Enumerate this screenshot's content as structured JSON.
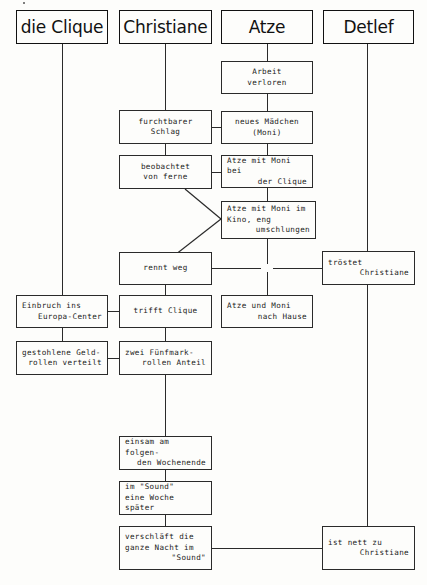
{
  "diagram": {
    "actors": [
      {
        "id": "clique",
        "label": "die Clique"
      },
      {
        "id": "christiane",
        "label": "Christiane"
      },
      {
        "id": "atze",
        "label": "Atze"
      },
      {
        "id": "detlef",
        "label": "Detlef"
      }
    ],
    "nodes": [
      {
        "id": "arbeit",
        "column": "atze",
        "lines": [
          "Arbeit",
          "verloren"
        ],
        "align": "center"
      },
      {
        "id": "schlag",
        "column": "christiane",
        "lines": [
          "furchtbarer",
          "Schlag"
        ],
        "align": "center"
      },
      {
        "id": "moni",
        "column": "atze",
        "lines": [
          "neues Mädchen",
          "(Moni)"
        ],
        "align": "center"
      },
      {
        "id": "beobachtet",
        "column": "christiane",
        "lines": [
          "beobachtet",
          "von ferne"
        ],
        "align": "center"
      },
      {
        "id": "beiclique",
        "column": "atze",
        "lines": [
          "Atze mit Moni bei",
          "der Clique"
        ],
        "align": "mixed-r"
      },
      {
        "id": "kino",
        "column": "atze",
        "lines": [
          "Atze mit Moni im",
          "Kino, eng",
          "umschlungen"
        ],
        "align": "mixed-r"
      },
      {
        "id": "renntweg",
        "column": "christiane",
        "lines": [
          "rennt weg"
        ],
        "align": "center"
      },
      {
        "id": "troestet",
        "column": "detlef",
        "lines": [
          "tröstet",
          "Christiane"
        ],
        "align": "mixed-r"
      },
      {
        "id": "einbruch",
        "column": "clique",
        "lines": [
          "Einbruch ins",
          "Europa-Center"
        ],
        "align": "mixed-r"
      },
      {
        "id": "trifft",
        "column": "christiane",
        "lines": [
          "trifft Clique"
        ],
        "align": "center"
      },
      {
        "id": "nachhause",
        "column": "atze",
        "lines": [
          "Atze und Moni",
          "nach Hause"
        ],
        "align": "mixed-r"
      },
      {
        "id": "gestohlene",
        "column": "clique",
        "lines": [
          "gestohlene Geld-",
          "rollen verteilt"
        ],
        "align": "mixed-r"
      },
      {
        "id": "fuenfmark",
        "column": "christiane",
        "lines": [
          "zwei Fünfmark-",
          "rollen Anteil"
        ],
        "align": "mixed-r"
      },
      {
        "id": "einsam",
        "column": "christiane",
        "lines": [
          "einsam am folgen-",
          "den Wochenende"
        ],
        "align": "mixed-r"
      },
      {
        "id": "sound",
        "column": "christiane",
        "lines": [
          "im \"Sound\"",
          "eine Woche später"
        ],
        "align": "left"
      },
      {
        "id": "verschlaeft",
        "column": "christiane",
        "lines": [
          "verschläft die",
          "ganze Nacht im",
          "\"Sound\""
        ],
        "align": "mixed-r"
      },
      {
        "id": "nettzu",
        "column": "detlef",
        "lines": [
          "ist nett zu",
          "Christiane"
        ],
        "align": "mixed-r"
      }
    ]
  }
}
